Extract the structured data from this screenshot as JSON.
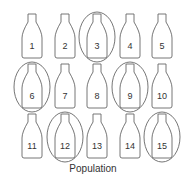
{
  "diagram": {
    "caption": "Population",
    "columns": 5,
    "bottles": [
      {
        "label": "1",
        "selected": false
      },
      {
        "label": "2",
        "selected": false
      },
      {
        "label": "3",
        "selected": true
      },
      {
        "label": "4",
        "selected": false
      },
      {
        "label": "5",
        "selected": false
      },
      {
        "label": "6",
        "selected": true
      },
      {
        "label": "7",
        "selected": false
      },
      {
        "label": "8",
        "selected": false
      },
      {
        "label": "9",
        "selected": true
      },
      {
        "label": "10",
        "selected": false
      },
      {
        "label": "11",
        "selected": false
      },
      {
        "label": "12",
        "selected": true
      },
      {
        "label": "13",
        "selected": false
      },
      {
        "label": "14",
        "selected": false
      },
      {
        "label": "15",
        "selected": true
      }
    ],
    "colors": {
      "stroke": "#666666",
      "text": "#333333"
    }
  }
}
